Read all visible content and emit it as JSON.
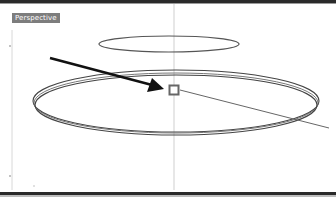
{
  "viewport": {
    "title": "Perspective",
    "label_bg": "#7d7d7d",
    "label_fg": "#ffffff"
  },
  "scene": {
    "objects": [
      {
        "type": "ellipse",
        "name": "upper-circle",
        "cx": 169,
        "cy": 44,
        "rx": 70,
        "ry": 8,
        "stroke": "#555555"
      },
      {
        "type": "ellipse-ring",
        "name": "lower-ring",
        "cx": 176,
        "cy": 102,
        "rx": 143,
        "ry": 31,
        "stroke": "#4a4a4a",
        "lines": 3
      },
      {
        "type": "point",
        "name": "selected-point",
        "x": 174,
        "y": 90,
        "size": 9,
        "stroke": "#666666"
      },
      {
        "type": "line",
        "name": "diagonal-line",
        "x1": 180,
        "y1": 90,
        "x2": 329,
        "y2": 128,
        "stroke": "#666666"
      },
      {
        "type": "axis",
        "name": "vertical-axis",
        "x": 174,
        "y1": 4,
        "y2": 190,
        "stroke": "#cfcfcf"
      },
      {
        "type": "arrow",
        "name": "annotation-arrow",
        "x1": 50,
        "y1": 58,
        "x2": 164,
        "y2": 88,
        "fill": "#111111"
      }
    ]
  }
}
